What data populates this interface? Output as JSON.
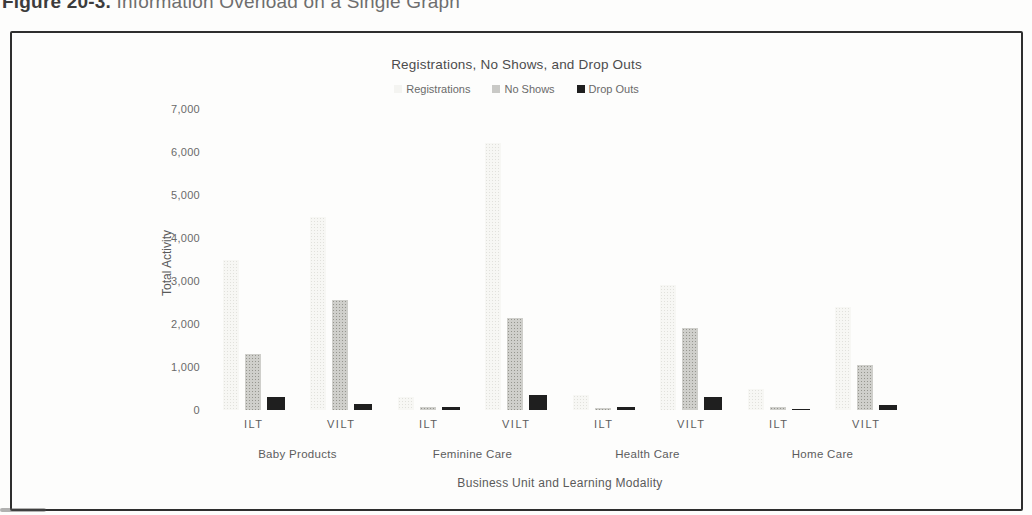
{
  "page": {
    "caption_prefix": "Figure 20-3.",
    "caption_rest": " Information Overload on a Single Graph"
  },
  "colors": {
    "registrations": "#f7f7f4",
    "no_shows": "#cfcfcb",
    "drop_outs": "#1f1f1f",
    "frame_border": "#2e2e2e",
    "text": "#5a5a5a"
  },
  "chart_data": {
    "type": "bar",
    "title": "Registrations, No Shows, and Drop Outs",
    "xlabel": "Business Unit and Learning Modality",
    "ylabel": "Total Activity",
    "ylim": [
      0,
      7000
    ],
    "yticks": [
      0,
      1000,
      2000,
      3000,
      4000,
      5000,
      6000,
      7000
    ],
    "grid": false,
    "legend_position": "top",
    "groups": [
      "Baby Products",
      "Feminine Care",
      "Health Care",
      "Home Care"
    ],
    "modality_labels": [
      "ILT",
      "VILT",
      "ILT",
      "VILT",
      "ILT",
      "VILT",
      "ILT",
      "VILT"
    ],
    "categories": [
      "Baby Products ILT",
      "Baby Products VILT",
      "Feminine Care ILT",
      "Feminine Care VILT",
      "Health Care ILT",
      "Health Care VILT",
      "Home Care ILT",
      "Home Care VILT"
    ],
    "series": [
      {
        "name": "Registrations",
        "values": [
          3500,
          4500,
          300,
          6200,
          350,
          2900,
          500,
          2400
        ]
      },
      {
        "name": "No Shows",
        "values": [
          1300,
          2550,
          60,
          2150,
          50,
          1900,
          80,
          1050
        ]
      },
      {
        "name": "Drop Outs",
        "values": [
          300,
          150,
          60,
          350,
          80,
          300,
          30,
          120
        ]
      }
    ]
  }
}
